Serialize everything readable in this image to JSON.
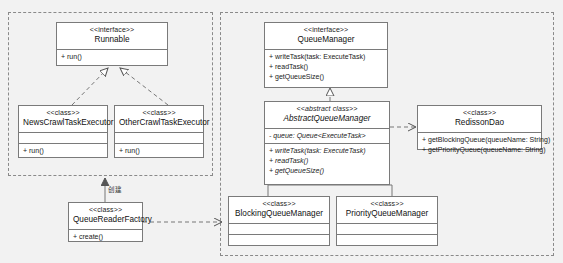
{
  "diagram": {
    "type": "uml-class-diagram",
    "background_color": "#f2f2f2",
    "node_fill": "#ffffff",
    "node_border": "#7a7a7a",
    "group_border": "#8a8a8a"
  },
  "groups": [
    {
      "name": "left-package",
      "label": ""
    },
    {
      "name": "right-package",
      "label": ""
    }
  ],
  "classes": {
    "runnable": {
      "stereotype": "<<interface>>",
      "name": "Runnable",
      "attributes": [],
      "methods": [
        "+ run()"
      ]
    },
    "news_crawl_task_executor": {
      "stereotype": "<<class>>",
      "name": "NewsCrawlTaskExecutor",
      "attributes": [],
      "methods": [
        "+ run()"
      ]
    },
    "other_crawl_task_executor": {
      "stereotype": "<<class>>",
      "name": "OtherCrawlTaskExecutor",
      "attributes": [],
      "methods": [
        "+ run()"
      ]
    },
    "queue_reader_factory": {
      "stereotype": "<<class>>",
      "name": "QueueReaderFactory",
      "attributes": [],
      "methods": [
        "+ create()"
      ]
    },
    "queue_manager": {
      "stereotype": "<<interface>>",
      "name": "QueueManager",
      "attributes": [],
      "methods": [
        "+ writeTask(task: ExecuteTask)",
        "+ readTask()",
        "+ getQueueSize()"
      ]
    },
    "abstract_queue_manager": {
      "stereotype": "<<abstract class>>",
      "name": "AbstractQueueManager",
      "attributes": [
        "- queue: Queue<ExecuteTask>"
      ],
      "methods": [
        "+ writeTask(task: ExecuteTask)",
        "+ readTask()",
        "+ getQueueSize()"
      ]
    },
    "redisson_dao": {
      "stereotype": "<<class>>",
      "name": "RedissonDao",
      "attributes": [],
      "methods": [
        "+ getBlockingQueue(queueName: String)",
        "+ getPriorityQueue(queueName: String)"
      ]
    },
    "blocking_queue_manager": {
      "stereotype": "<<class>>",
      "name": "BlockingQueueManager",
      "attributes": [],
      "methods": []
    },
    "priority_queue_manager": {
      "stereotype": "<<class>>",
      "name": "PriorityQueueManager",
      "attributes": [],
      "methods": []
    }
  },
  "edges": {
    "factory_to_runnable_label": "创建"
  }
}
